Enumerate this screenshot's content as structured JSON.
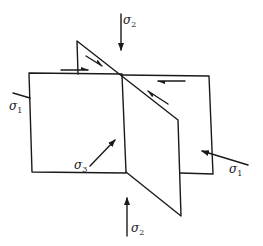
{
  "diagram": {
    "labels": {
      "sigma2_top": {
        "symbol": "σ",
        "sub": "2"
      },
      "sigma2_bottom": {
        "symbol": "σ",
        "sub": "2"
      },
      "sigma1_left": {
        "symbol": "σ",
        "sub": "1"
      },
      "sigma1_right": {
        "symbol": "σ",
        "sub": "1"
      },
      "sigma3": {
        "symbol": "σ",
        "sub": "3"
      }
    },
    "colors": {
      "line": "#1a1a1a",
      "background": "#ffffff"
    },
    "planes": [
      {
        "name": "horizontal-plane",
        "description": "rectangular plane"
      },
      {
        "name": "vertical-plane",
        "description": "vertical dividing plane"
      },
      {
        "name": "inclined-plane",
        "description": "oblique shear plane"
      }
    ],
    "shear_arrows": [
      {
        "name": "shear-arrow-top-left-horizontal",
        "direction": "right"
      },
      {
        "name": "shear-arrow-top-left-inclined",
        "direction": "down-right"
      },
      {
        "name": "shear-arrow-top-right-horizontal",
        "direction": "left"
      },
      {
        "name": "shear-arrow-right-inclined",
        "direction": "up-left"
      }
    ]
  }
}
